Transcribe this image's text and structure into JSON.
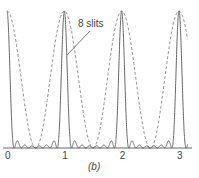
{
  "chart_data": {
    "type": "line",
    "title": "",
    "caption": "(b)",
    "xlabel": "",
    "ylabel": "",
    "x_ticks": [
      "0",
      "1",
      "2",
      "3"
    ],
    "xlim": [
      0,
      3.15
    ],
    "ylim": [
      0,
      1
    ],
    "grid": false,
    "series": [
      {
        "name": "8 slits",
        "style": "solid",
        "slits": 8,
        "description": "N-slit interference intensity, principal maxima at integer orders"
      },
      {
        "name": "envelope",
        "style": "dashed",
        "slits": 2,
        "description": "two-slit cos^2 pattern"
      }
    ],
    "annotation": {
      "text": "8 slits",
      "points_to": "principal maximum at order 1"
    }
  }
}
